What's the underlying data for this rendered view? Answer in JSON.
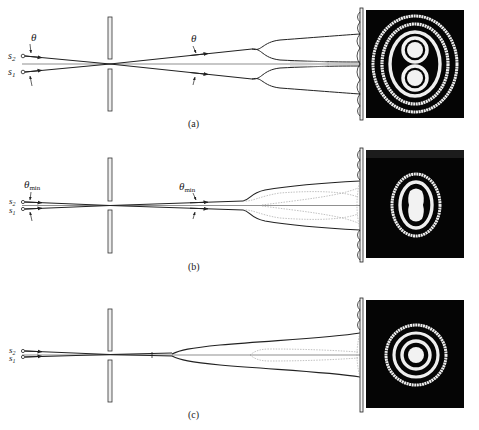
{
  "figure": {
    "colors": {
      "ink": "#222222",
      "background": "#ffffff",
      "pattern_bg": "#050505",
      "fringe": "#f2f2f2",
      "dotted": "#888888"
    },
    "panels": [
      {
        "id": "a",
        "caption": "(a)",
        "source_labels": {
          "s2": "s",
          "s2_sub": "2",
          "s1": "s",
          "s1_sub": "1"
        },
        "angle_label_left": "θ",
        "angle_label_left_sub": "",
        "angle_label_right": "θ",
        "angle_label_right_sub": "",
        "pattern": "two well-separated overlapping ring systems (figure-8)"
      },
      {
        "id": "b",
        "caption": "(b)",
        "source_labels": {
          "s2": "s",
          "s2_sub": "2",
          "s1": "s",
          "s1_sub": "1"
        },
        "angle_label_left": "θ",
        "angle_label_left_sub": "min",
        "angle_label_right": "θ",
        "angle_label_right_sub": "min",
        "pattern": "just-resolved ring systems (Rayleigh limit)"
      },
      {
        "id": "c",
        "caption": "(c)",
        "source_labels": {
          "s2": "s",
          "s2_sub": "2",
          "s1": "s",
          "s1_sub": "1"
        },
        "angle_label_left": "",
        "angle_label_left_sub": "",
        "angle_label_right": "",
        "angle_label_right_sub": "",
        "pattern": "unresolved single ring system"
      }
    ]
  }
}
